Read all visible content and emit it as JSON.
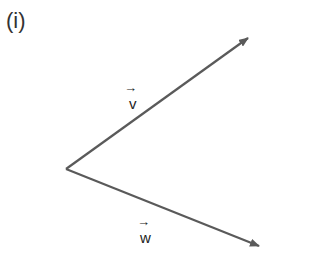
{
  "figure_label": "(i)",
  "vectors": [
    {
      "name": "v",
      "label": "v",
      "arrow": "→",
      "from": [
        66,
        169
      ],
      "to": [
        249,
        37
      ]
    },
    {
      "name": "w",
      "label": "w",
      "arrow": "→",
      "from": [
        66,
        169
      ],
      "to": [
        260,
        247
      ]
    }
  ],
  "colors": {
    "line": "#5a5a5a",
    "text": "#222222"
  }
}
